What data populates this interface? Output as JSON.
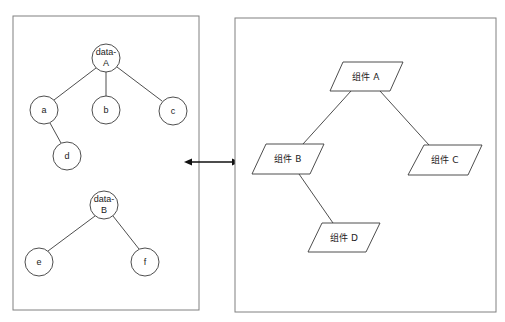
{
  "diagram": {
    "colors": {
      "panel_border": "#808080",
      "edge": "#3a3a3a",
      "arrow": "#111111",
      "text": "#222222",
      "background": "#ffffff"
    },
    "left_panel": {
      "label": "data trees",
      "rect": {
        "x": 13,
        "y": 16,
        "w": 186,
        "h": 294
      },
      "node_radius": 14,
      "trees": [
        {
          "root": {
            "id": "data-A",
            "line1": "data-",
            "line2": "A",
            "cx": 106,
            "cy": 58
          },
          "children": [
            {
              "id": "a",
              "label": "a",
              "cx": 44,
              "cy": 110,
              "parent": "data-A"
            },
            {
              "id": "b",
              "label": "b",
              "cx": 106,
              "cy": 110,
              "parent": "data-A"
            },
            {
              "id": "c",
              "label": "c",
              "cx": 173,
              "cy": 111,
              "parent": "data-A"
            },
            {
              "id": "d",
              "label": "d",
              "cx": 67,
              "cy": 156,
              "parent": "a"
            }
          ]
        },
        {
          "root": {
            "id": "data-B",
            "line1": "data-",
            "line2": "B",
            "cx": 104,
            "cy": 205
          },
          "children": [
            {
              "id": "e",
              "label": "e",
              "cx": 39,
              "cy": 262,
              "parent": "data-B"
            },
            {
              "id": "f",
              "label": "f",
              "cx": 145,
              "cy": 262,
              "parent": "data-B"
            }
          ]
        }
      ]
    },
    "connector": {
      "type": "bidirectional-arrow",
      "x1": 184,
      "x2": 240,
      "y": 162
    },
    "right_panel": {
      "label": "component tree",
      "rect": {
        "x": 235,
        "y": 18,
        "w": 261,
        "h": 294
      },
      "components": [
        {
          "id": "A",
          "label": "组件 A",
          "points": "343,62 403,62 390,91 330,91",
          "cx": 366,
          "cy": 77
        },
        {
          "id": "B",
          "label": "组件 B",
          "points": "266,144 324,144 310,174 252,174",
          "cx": 288,
          "cy": 159
        },
        {
          "id": "C",
          "label": "组件 C",
          "points": "424,145 482,145 468,175 408,175",
          "cx": 445,
          "cy": 160
        },
        {
          "id": "D",
          "label": "组件 D",
          "points": "322,223 380,223 366,252 308,252",
          "cx": 344,
          "cy": 238
        }
      ],
      "edges": [
        {
          "from": "A",
          "to": "B",
          "x1": 351,
          "y1": 91,
          "x2": 303,
          "y2": 144
        },
        {
          "from": "A",
          "to": "C",
          "x1": 380,
          "y1": 91,
          "x2": 429,
          "y2": 145
        },
        {
          "from": "B",
          "to": "D",
          "x1": 299,
          "y1": 174,
          "x2": 333,
          "y2": 223
        }
      ]
    }
  }
}
